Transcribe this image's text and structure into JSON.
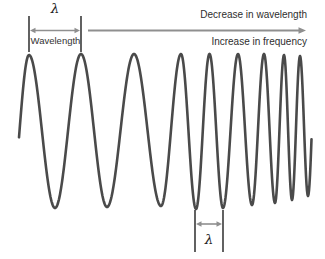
{
  "labels": {
    "lambda_top": "λ",
    "wavelength": "Wavelength",
    "decrease_in_wavelength": "Decrease in wavelength",
    "increase_in_frequency": "Increase in frequency",
    "lambda_bottom": "λ"
  },
  "colors": {
    "wave": "#4a4a4a",
    "tick": "#1f1f1f",
    "arrow": "#8f8f8f",
    "text": "#2e2e2e",
    "background": "#ffffff"
  },
  "wave": {
    "description": "Sinusoidal wave whose wavelength decreases (frequency increases) from left to right",
    "start_x": 19,
    "end_x": 311.5,
    "stroke_width": 2.6,
    "extremes": [
      [
        10,
        207
      ],
      [
        29,
        55
      ],
      [
        55,
        208
      ],
      [
        81,
        54
      ],
      [
        107,
        207
      ],
      [
        134,
        54
      ],
      [
        161,
        206
      ],
      [
        181,
        54
      ],
      [
        196,
        209
      ],
      [
        209.5,
        54
      ],
      [
        223,
        208
      ],
      [
        238,
        54
      ],
      [
        252,
        205
      ],
      [
        264,
        54
      ],
      [
        275,
        203
      ],
      [
        284,
        55
      ],
      [
        292,
        200
      ],
      [
        300,
        56
      ],
      [
        308,
        196
      ],
      [
        316,
        55
      ]
    ]
  },
  "markers": {
    "top_span": {
      "x1": 29,
      "x2": 81,
      "tick_y1": 16,
      "tick_y2": 52,
      "arrow_y": 30.5
    },
    "bottom_span": {
      "x1": 195,
      "x2": 223,
      "tick_y1": 210,
      "tick_y2": 252,
      "arrow_y": 224
    },
    "direction_arrow": {
      "x1": 88,
      "x2": 306,
      "y": 30.5
    }
  }
}
